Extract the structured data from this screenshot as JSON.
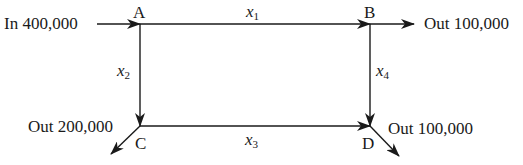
{
  "diagram": {
    "type": "network-flow",
    "nodes": [
      {
        "id": "A",
        "label": "A"
      },
      {
        "id": "B",
        "label": "B"
      },
      {
        "id": "C",
        "label": "C"
      },
      {
        "id": "D",
        "label": "D"
      }
    ],
    "edges": [
      {
        "from": "A",
        "to": "B",
        "var": "x",
        "sub": "1"
      },
      {
        "from": "A",
        "to": "C",
        "var": "x",
        "sub": "2"
      },
      {
        "from": "C",
        "to": "D",
        "var": "x",
        "sub": "3"
      },
      {
        "from": "B",
        "to": "D",
        "var": "x",
        "sub": "4"
      }
    ],
    "flows": {
      "in_a": "In 400,000",
      "out_b": "Out 100,000",
      "out_c": "Out 200,000",
      "out_d": "Out 100,000"
    },
    "colors": {
      "ink": "#1a1a1a",
      "background": "#ffffff"
    }
  }
}
